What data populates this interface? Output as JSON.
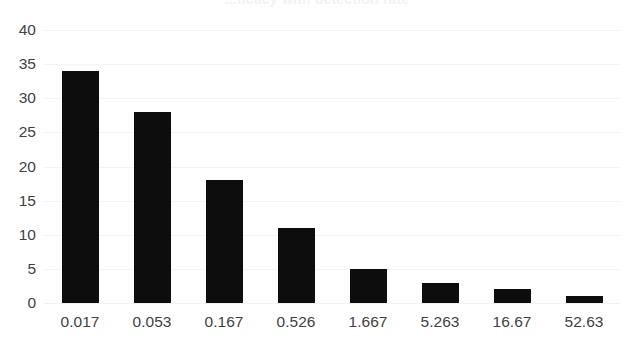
{
  "chart_data": {
    "type": "bar",
    "title": "...ficacy with detection rate",
    "title_clipped": true,
    "xlabel": "",
    "ylabel": "",
    "categories": [
      "0.017",
      "0.053",
      "0.167",
      "0.526",
      "1.667",
      "5.263",
      "16.67",
      "52.63"
    ],
    "values": [
      34,
      28,
      18,
      11,
      5,
      3,
      2,
      1
    ],
    "ylim": [
      0,
      40
    ],
    "yticks": [
      0,
      5,
      10,
      15,
      20,
      25,
      30,
      35,
      40
    ],
    "ytick_labels": [
      "0",
      "5",
      "10",
      "15",
      "20",
      "25",
      "30",
      "35",
      "40"
    ],
    "grid": true,
    "grid_orientation": "horizontal",
    "legend": false,
    "bar_color": "#0d0d0d",
    "grid_color": "#f4f4f6",
    "tick_label_color": "#3f3f3f",
    "background_color": "#ffffff"
  }
}
